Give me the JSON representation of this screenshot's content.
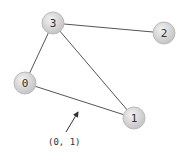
{
  "graph": {
    "nodes": [
      {
        "id": "0",
        "label": "0",
        "x": 25,
        "y": 83
      },
      {
        "id": "1",
        "label": "1",
        "x": 134,
        "y": 118
      },
      {
        "id": "2",
        "label": "2",
        "x": 164,
        "y": 33
      },
      {
        "id": "3",
        "label": "3",
        "x": 53,
        "y": 23
      }
    ],
    "edges": [
      {
        "from": "3",
        "to": "2"
      },
      {
        "from": "3",
        "to": "0"
      },
      {
        "from": "3",
        "to": "1"
      },
      {
        "from": "0",
        "to": "1"
      }
    ],
    "annotation": {
      "label": "(0, 1)",
      "target_edge": "0-1"
    }
  },
  "colors": {
    "node_fill": "#d4d4d4",
    "node_stroke": "#b8b8b8",
    "edge": "#555555",
    "text": "#333333"
  }
}
